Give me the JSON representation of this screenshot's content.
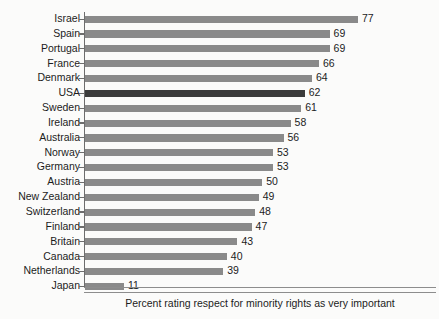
{
  "chart_data": {
    "type": "bar",
    "orientation": "horizontal",
    "title": "",
    "xlabel": "Percent rating respect for minority rights as very important",
    "ylabel": "",
    "xlim": [
      0,
      77
    ],
    "grid": false,
    "legend": null,
    "highlight_category": "USA",
    "colors": {
      "bar": "#8a8a8a",
      "bar_highlight": "#3b3b3b",
      "axis": "#6d6d6d",
      "text": "#1c1c1c",
      "background": "#fbfbfa"
    },
    "categories": [
      "Israel",
      "Spain",
      "Portugal",
      "France",
      "Denmark",
      "USA",
      "Sweden",
      "Ireland",
      "Australia",
      "Norway",
      "Germany",
      "Austria",
      "New Zealand",
      "Switzerland",
      "Finland",
      "Britain",
      "Canada",
      "Netherlands",
      "Japan"
    ],
    "values": [
      77,
      69,
      69,
      66,
      64,
      62,
      61,
      58,
      56,
      53,
      53,
      50,
      49,
      48,
      47,
      43,
      40,
      39,
      11
    ]
  },
  "caption": {
    "text": "Percent rating respect for minority rights as very important"
  },
  "background_ghost_text": {
    "line_a": "",
    "line_b": "",
    "line_c": ""
  }
}
